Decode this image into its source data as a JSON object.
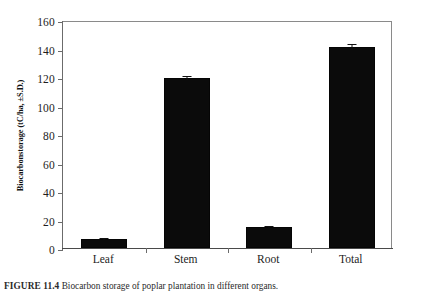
{
  "figure": {
    "caption_label": "FIGURE 11.4",
    "caption_text": "Biocarbon storage of poplar plantation in different organs."
  },
  "axes": {
    "y_title": "Biocarbonstorage (tC/ha, ±S.D.)",
    "y_ticks": [
      "0",
      "20",
      "40",
      "60",
      "80",
      "100",
      "120",
      "140",
      "160"
    ],
    "x_labels": [
      "Leaf",
      "Stem",
      "Root",
      "Total"
    ]
  },
  "chart_data": {
    "type": "bar",
    "title": "",
    "xlabel": "",
    "ylabel": "Biocarbonstorage (tC/ha, ±S.D.)",
    "categories": [
      "Leaf",
      "Stem",
      "Root",
      "Total"
    ],
    "values": [
      6.5,
      119.5,
      14.5,
      141.0
    ],
    "errors": [
      0.6,
      1.5,
      0.7,
      2.0
    ],
    "ylim": [
      0,
      160
    ],
    "ytick_step": 20,
    "grid": false,
    "legend": "none",
    "bar_color": "#0b0b0b",
    "error_bar_color": "#111111"
  }
}
